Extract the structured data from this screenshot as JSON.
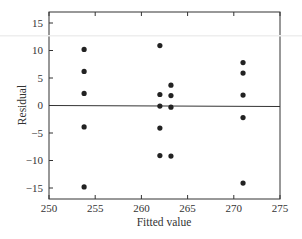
{
  "chart_data": {
    "type": "scatter",
    "title": "",
    "xlabel": "Fitted value",
    "ylabel": "Residual",
    "xlim": [
      250,
      275
    ],
    "ylim": [
      -17,
      17
    ],
    "xticks": [
      250,
      255,
      260,
      265,
      270,
      275
    ],
    "yticks": [
      15,
      10,
      5,
      0,
      -5,
      -10,
      -15
    ],
    "grid": false,
    "legend": null,
    "reference_line": {
      "y": 0
    },
    "series": [
      {
        "name": "Residuals",
        "x": [
          253.8,
          253.8,
          253.8,
          253.8,
          253.8,
          262.0,
          262.0,
          262.0,
          262.0,
          262.0,
          263.2,
          263.2,
          263.2,
          263.2,
          271.0,
          271.0,
          271.0,
          271.0,
          271.0
        ],
        "y": [
          10.2,
          6.2,
          2.2,
          -3.9,
          -14.8,
          10.9,
          2.0,
          -0.1,
          -4.1,
          -9.1,
          3.7,
          1.8,
          -0.3,
          -9.2,
          7.8,
          5.9,
          1.9,
          -2.2,
          -14.1
        ]
      }
    ]
  }
}
